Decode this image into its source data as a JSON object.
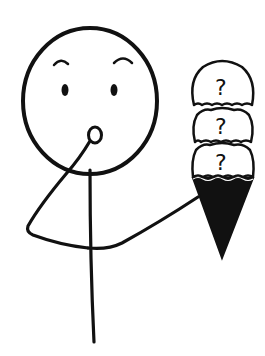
{
  "illustration": {
    "subject": "stick-figure-holding-ice-cream-cone",
    "expression": "surprised",
    "colors": {
      "background": "#ffffff",
      "stroke": "#111111",
      "cone_fill": "#111111",
      "scoop_fill": "#ffffff"
    },
    "ice_cream": {
      "scoops": [
        {
          "label": "?"
        },
        {
          "label": "?"
        },
        {
          "label": "?"
        }
      ]
    }
  }
}
